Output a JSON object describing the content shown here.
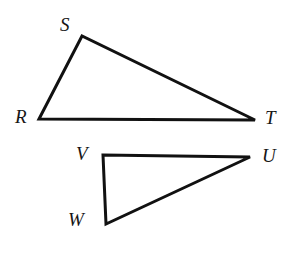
{
  "figure": {
    "kind": "geometry-diagram",
    "background_color": "#ffffff",
    "stroke_color": "#111111",
    "stroke_width": 3,
    "label_color": "#161616",
    "shapes": [
      {
        "name": "triangle-rst",
        "vertices": [
          {
            "label": "R",
            "x": 39,
            "y": 119
          },
          {
            "label": "S",
            "x": 82,
            "y": 36
          },
          {
            "label": "T",
            "x": 255,
            "y": 120
          }
        ]
      },
      {
        "name": "triangle-vuw",
        "vertices": [
          {
            "label": "V",
            "x": 103,
            "y": 155
          },
          {
            "label": "U",
            "x": 250,
            "y": 157
          },
          {
            "label": "W",
            "x": 106,
            "y": 224
          }
        ]
      }
    ],
    "labels": [
      {
        "name": "vertex-label-s",
        "text": "S",
        "x": 60,
        "y": 15
      },
      {
        "name": "vertex-label-r",
        "text": "R",
        "x": 15,
        "y": 107
      },
      {
        "name": "vertex-label-t",
        "text": "T",
        "x": 265,
        "y": 108
      },
      {
        "name": "vertex-label-v",
        "text": "V",
        "x": 76,
        "y": 144
      },
      {
        "name": "vertex-label-u",
        "text": "U",
        "x": 262,
        "y": 146
      },
      {
        "name": "vertex-label-w",
        "text": "W",
        "x": 68,
        "y": 210
      }
    ]
  }
}
